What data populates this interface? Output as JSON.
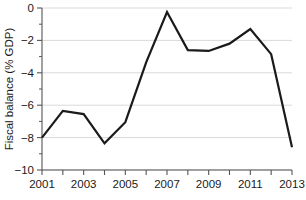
{
  "chart_data": {
    "type": "line",
    "title": "",
    "subtitle": "",
    "xlabel": "",
    "ylabel": "Fiscal balance (% GDP)",
    "x": [
      2001,
      2002,
      2003,
      2004,
      2005,
      2006,
      2007,
      2008,
      2009,
      2010,
      2011,
      2012,
      2013
    ],
    "values": [
      -8.0,
      -6.35,
      -6.55,
      -8.35,
      -7.05,
      -3.35,
      -0.25,
      -2.6,
      -2.65,
      -2.2,
      -1.3,
      -2.85,
      -8.6
    ],
    "series": [
      {
        "name": "Fiscal balance",
        "values": [
          -8.0,
          -6.35,
          -6.55,
          -8.35,
          -7.05,
          -3.35,
          -0.25,
          -2.6,
          -2.65,
          -2.2,
          -1.3,
          -2.85,
          -8.6
        ]
      }
    ],
    "xlim": [
      2001,
      2013
    ],
    "ylim": [
      -10,
      0
    ],
    "xticks": [
      2001,
      2002,
      2003,
      2004,
      2005,
      2006,
      2007,
      2008,
      2009,
      2010,
      2011,
      2012,
      2013
    ],
    "xtick_labels": [
      "2001",
      "",
      "2003",
      "",
      "2005",
      "",
      "2007",
      "",
      "2009",
      "",
      "2011",
      "",
      "2013"
    ],
    "yticks": [
      0,
      -2,
      -4,
      -6,
      -8,
      -10
    ],
    "ytick_labels": [
      "0",
      "−2",
      "−4",
      "−6",
      "−8",
      "−10"
    ],
    "yticks_minor": [
      -1,
      -3,
      -5,
      -7,
      -9
    ],
    "grid": true,
    "grid_axis": "y",
    "legend": false,
    "legend_position": "none",
    "annotations": [],
    "colors": {
      "line": "#1a1a1a",
      "grid": "#d9d9d9",
      "axis": "#555555",
      "background": "#ffffff",
      "text": "#1a1a1a"
    },
    "line_width": 2.2
  },
  "axis": {
    "y_title": "Fiscal balance (% GDP)"
  }
}
